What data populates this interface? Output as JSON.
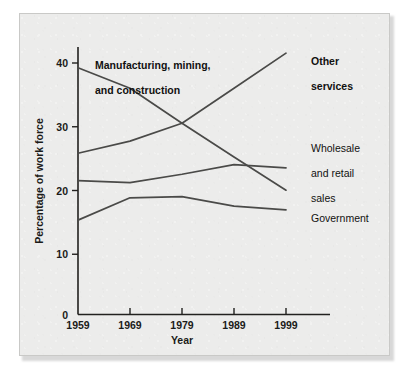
{
  "figure": {
    "background_color": "#ececeb",
    "page_color": "#ffffff",
    "border_color": "#c9c9c7",
    "line_color": "#4a4a48",
    "axis_color": "#22211f",
    "text_color": "#111110"
  },
  "chart_data": {
    "type": "line",
    "title": "",
    "subtitle": "",
    "xlabel": "Year",
    "ylabel": "Percentage of work force",
    "x": [
      1959,
      1969,
      1979,
      1989,
      1999
    ],
    "xtick_labels": [
      "1959",
      "1969",
      "1979",
      "1989",
      "1999"
    ],
    "ytick_labels": [
      "0",
      "10",
      "20",
      "30",
      "40"
    ],
    "yticks": [
      0,
      10,
      20,
      30,
      40
    ],
    "xlim": [
      1959,
      2004
    ],
    "ylim": [
      0,
      42
    ],
    "grid": false,
    "legend": "inline-labels",
    "legend_position": "right-of-plot-and-inside",
    "series": [
      {
        "name": "Manufacturing, mining, and construction",
        "label_text": "Manufacturing, mining,\nand construction",
        "label_bold": true,
        "label_position": "inside-top-left",
        "values": [
          38.7,
          35.5,
          30.0,
          24.7,
          19.5
        ]
      },
      {
        "name": "Other services",
        "label_text": "Other\nservices",
        "label_bold": true,
        "label_position": "right-top",
        "values": [
          25.3,
          27.2,
          30.0,
          35.5,
          41.0
        ]
      },
      {
        "name": "Wholesale and retail sales",
        "label_text": "Wholesale\nand retail\nsales",
        "label_bold": false,
        "label_position": "right-middle",
        "values": [
          21.0,
          20.7,
          22.0,
          23.5,
          23.0
        ]
      },
      {
        "name": "Government",
        "label_text": "Government",
        "label_bold": false,
        "label_position": "right-lower",
        "values": [
          14.8,
          18.3,
          18.5,
          17.0,
          16.4
        ]
      }
    ]
  },
  "labels": {
    "manufacturing_line1": "Manufacturing, mining,",
    "manufacturing_line2": "and construction",
    "other_services_line1": "Other",
    "other_services_line2": "services",
    "wholesale_line1": "Wholesale",
    "wholesale_line2": "and retail",
    "wholesale_line3": "sales",
    "government": "Government"
  },
  "axes": {
    "y_title": "Percentage of work force",
    "x_title": "Year",
    "y_ticks": [
      "40",
      "30",
      "20",
      "10",
      "0"
    ],
    "x_ticks": [
      "1959",
      "1969",
      "1979",
      "1989",
      "1999"
    ]
  }
}
